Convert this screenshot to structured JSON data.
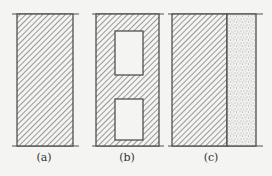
{
  "figure": {
    "background": "#f4f4f2",
    "line_color": "#555555",
    "panels": [
      {
        "id": "a",
        "label": "(a)",
        "description": "solid hatched wall section"
      },
      {
        "id": "b",
        "label": "(b)",
        "description": "hatched wall section with two rectangular voids"
      },
      {
        "id": "c",
        "label": "(c)",
        "description": "hatched wall section with stippled layer on the right"
      }
    ]
  }
}
